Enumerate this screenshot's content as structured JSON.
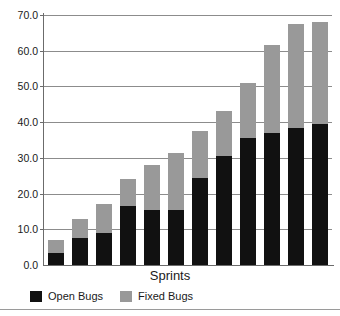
{
  "chart_data": {
    "type": "bar",
    "subtype": "stacked-bar",
    "title": "",
    "xlabel": "Sprints",
    "ylabel": "",
    "ylim": [
      0.0,
      70.0
    ],
    "ytick_labels": [
      "0.0",
      "10.0",
      "20.0",
      "30.0",
      "40.0",
      "50.0",
      "60.0",
      "70.0"
    ],
    "ytick_values": [
      0.0,
      10.0,
      20.0,
      30.0,
      40.0,
      50.0,
      60.0,
      70.0
    ],
    "grid": true,
    "grid_axis": "y",
    "legend_position": "bottom-left",
    "categories": [
      "1",
      "2",
      "3",
      "4",
      "5",
      "6",
      "7",
      "8",
      "9",
      "10",
      "11",
      "12"
    ],
    "xtick_labels_visible": false,
    "series": [
      {
        "name": "Open Bugs",
        "color": "#111111",
        "values": [
          3.5,
          7.5,
          9.0,
          16.5,
          15.5,
          15.5,
          24.5,
          30.5,
          35.5,
          37.0,
          38.5,
          39.5
        ]
      },
      {
        "name": "Fixed Bugs",
        "color": "#999999",
        "values": [
          3.5,
          5.5,
          8.0,
          7.5,
          12.5,
          16.0,
          13.0,
          12.5,
          15.5,
          24.5,
          29.0,
          28.5
        ]
      }
    ],
    "totals": [
      7.0,
      13.0,
      17.0,
      24.0,
      28.0,
      31.5,
      37.5,
      43.0,
      51.0,
      61.5,
      67.5,
      68.0
    ]
  },
  "legend": {
    "items": [
      {
        "label": "Open Bugs",
        "color": "#111111"
      },
      {
        "label": "Fixed Bugs",
        "color": "#999999"
      }
    ]
  }
}
